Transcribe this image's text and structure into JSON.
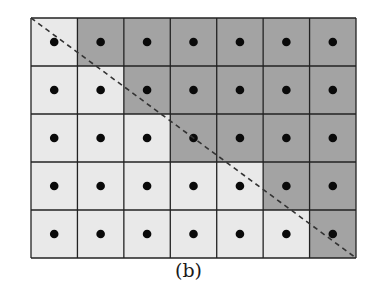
{
  "figure": {
    "caption": "(b)",
    "grid": {
      "rows": 5,
      "cols": 7,
      "left": 31,
      "top": 18,
      "right": 356,
      "bottom": 258,
      "light_cells_per_row": [
        1,
        2,
        3,
        5,
        6
      ],
      "light_color": "#e9e9e9",
      "dark_color": "#a3a3a3",
      "line_color": "#222222",
      "dot_color": "#0a0a0a",
      "dot_radius": 4.3
    },
    "diagonal": {
      "x1": 31,
      "y1": 18,
      "x2": 356,
      "y2": 258,
      "style": "dashed",
      "color": "#333333"
    }
  }
}
